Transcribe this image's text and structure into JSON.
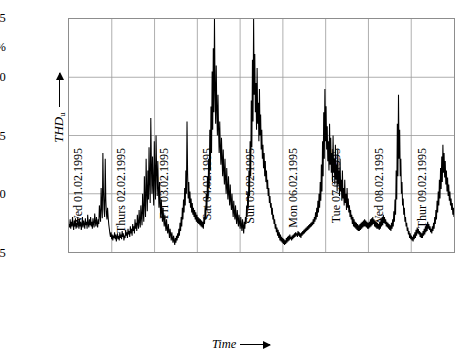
{
  "chart_data": {
    "type": "line",
    "title": "",
    "xlabel": "Time",
    "ylabel": "THD_u",
    "ylabel_display": "THD",
    "ylabel_subscript": "u",
    "yunit": "%",
    "ylim": [
      0.5,
      2.5
    ],
    "yticks": [
      0.5,
      1.0,
      1.5,
      2.0,
      2.5
    ],
    "ytick_labels": [
      "0.5",
      "1.0",
      "1.5",
      "2.0",
      "2.5"
    ],
    "grid": true,
    "legend": false,
    "xlim": [
      0,
      9
    ],
    "xtick_labels": [
      "Wed 01.02.1995",
      "Thurs 02.02.1995",
      "Fri 03.02.1995",
      "Sat 04.02.1995",
      "Sun 05.02.1995",
      "Mon 06.02.1995",
      "Tue 07.02.1995",
      "Wed 08.02.1995",
      "Thur 09.02.1995"
    ],
    "series": [
      {
        "name": "THD_u",
        "color": "#000000",
        "note": "Voltage total harmonic distortion sampled over 9 days; baseline 0.6-0.8 % with daytime excursions and narrow spikes up to 2.55 %.",
        "values": [
          0.74,
          0.71,
          0.78,
          0.7,
          0.76,
          0.72,
          0.8,
          0.73,
          0.69,
          0.77,
          0.72,
          0.79,
          0.7,
          0.75,
          0.71,
          0.8,
          0.74,
          0.7,
          0.78,
          0.72,
          0.76,
          0.69,
          0.73,
          0.8,
          0.71,
          0.77,
          0.74,
          0.7,
          0.79,
          0.73,
          0.76,
          0.7,
          0.82,
          0.74,
          0.71,
          0.78,
          0.73,
          0.8,
          0.72,
          0.76,
          0.7,
          0.79,
          0.74,
          0.71,
          0.83,
          0.76,
          0.72,
          0.8,
          0.75,
          0.71,
          0.78,
          0.74,
          0.9,
          0.82,
          0.76,
          1.05,
          0.88,
          0.79,
          1.35,
          1.02,
          0.86,
          0.8,
          1.3,
          0.95,
          0.83,
          0.78,
          0.88,
          0.8,
          0.74,
          0.7,
          0.66,
          0.63,
          0.67,
          0.61,
          0.65,
          0.6,
          0.64,
          0.62,
          0.67,
          0.61,
          0.65,
          0.59,
          0.63,
          0.66,
          0.61,
          0.64,
          0.6,
          0.67,
          0.62,
          0.65,
          0.61,
          0.68,
          0.63,
          0.66,
          0.6,
          0.64,
          0.62,
          0.69,
          0.64,
          0.67,
          0.62,
          0.7,
          0.65,
          0.68,
          0.63,
          0.72,
          0.66,
          0.7,
          0.64,
          0.74,
          0.68,
          0.72,
          0.66,
          0.78,
          0.7,
          0.75,
          0.68,
          0.82,
          0.74,
          0.7,
          0.86,
          0.76,
          0.71,
          0.9,
          0.8,
          0.73,
          1.0,
          0.85,
          0.76,
          1.15,
          0.92,
          0.8,
          1.3,
          1.02,
          0.85,
          1.2,
          0.95,
          1.4,
          1.1,
          0.92,
          1.65,
          1.25,
          1.0,
          1.32,
          1.08,
          0.9,
          1.45,
          1.15,
          0.95,
          1.5,
          1.2,
          0.98,
          1.28,
          1.05,
          0.88,
          1.1,
          0.92,
          0.8,
          0.95,
          0.84,
          0.76,
          0.88,
          0.78,
          0.72,
          0.82,
          0.74,
          0.68,
          0.78,
          0.7,
          0.66,
          0.74,
          0.68,
          0.62,
          0.7,
          0.65,
          0.6,
          0.67,
          0.62,
          0.58,
          0.64,
          0.6,
          0.56,
          0.62,
          0.58,
          0.64,
          0.6,
          0.66,
          0.62,
          0.7,
          0.64,
          0.75,
          0.68,
          0.8,
          0.72,
          0.88,
          0.78,
          0.95,
          0.84,
          1.05,
          0.9,
          1.2,
          1.0,
          1.62,
          1.18,
          0.96,
          1.1,
          0.92,
          1.02,
          0.88,
          0.96,
          0.84,
          0.92,
          0.82,
          0.88,
          0.8,
          0.86,
          0.78,
          0.84,
          0.76,
          0.82,
          0.75,
          0.8,
          0.74,
          0.79,
          0.73,
          0.78,
          0.72,
          0.77,
          0.71,
          0.76,
          0.7,
          0.8,
          0.74,
          0.88,
          0.78,
          1.0,
          0.86,
          1.15,
          0.95,
          1.3,
          1.05,
          1.55,
          1.2,
          1.75,
          1.35,
          2.05,
          1.55,
          2.25,
          1.7,
          2.55,
          1.9,
          1.6,
          2.1,
          1.72,
          1.5,
          1.85,
          1.55,
          1.35,
          1.62,
          1.4,
          1.25,
          1.48,
          1.3,
          1.15,
          1.38,
          1.2,
          1.08,
          1.3,
          1.12,
          1.0,
          1.22,
          1.05,
          0.95,
          1.15,
          1.0,
          0.9,
          1.08,
          0.94,
          0.86,
          1.0,
          0.88,
          0.8,
          0.94,
          0.84,
          0.78,
          0.9,
          0.8,
          0.74,
          0.86,
          0.78,
          0.72,
          0.82,
          0.75,
          0.7,
          0.8,
          0.73,
          0.68,
          0.78,
          0.72,
          0.66,
          0.76,
          0.7,
          0.8,
          0.74,
          0.9,
          0.8,
          1.02,
          0.88,
          1.2,
          0.98,
          1.45,
          1.15,
          1.8,
          1.4,
          2.15,
          1.62,
          2.5,
          1.85,
          2.2,
          1.7,
          1.95,
          1.55,
          2.08,
          1.6,
          1.78,
          1.45,
          1.9,
          1.5,
          1.68,
          1.38,
          1.55,
          1.3,
          1.42,
          1.22,
          1.35,
          1.15,
          1.28,
          1.1,
          1.2,
          1.04,
          1.12,
          0.98,
          1.05,
          0.92,
          0.98,
          0.88,
          0.92,
          0.82,
          0.88,
          0.78,
          0.82,
          0.74,
          0.78,
          0.7,
          0.74,
          0.67,
          0.71,
          0.64,
          0.69,
          0.62,
          0.67,
          0.6,
          0.65,
          0.59,
          0.63,
          0.58,
          0.62,
          0.57,
          0.61,
          0.56,
          0.6,
          0.57,
          0.62,
          0.58,
          0.63,
          0.59,
          0.64,
          0.6,
          0.65,
          0.61,
          0.63,
          0.6,
          0.64,
          0.61,
          0.65,
          0.62,
          0.66,
          0.63,
          0.67,
          0.64,
          0.66,
          0.63,
          0.68,
          0.64,
          0.67,
          0.63,
          0.66,
          0.62,
          0.67,
          0.64,
          0.68,
          0.65,
          0.69,
          0.66,
          0.7,
          0.67,
          0.71,
          0.68,
          0.72,
          0.69,
          0.73,
          0.7,
          0.74,
          0.71,
          0.75,
          0.72,
          0.76,
          0.73,
          0.78,
          0.74,
          0.8,
          0.76,
          0.84,
          0.78,
          0.88,
          0.8,
          0.94,
          0.84,
          1.0,
          0.88,
          1.1,
          0.94,
          1.25,
          1.02,
          1.45,
          1.15,
          1.7,
          1.3,
          1.9,
          1.45,
          1.75,
          1.38,
          1.58,
          1.28,
          1.45,
          1.2,
          1.6,
          1.25,
          1.48,
          1.18,
          1.35,
          1.1,
          1.5,
          1.18,
          1.3,
          1.08,
          1.42,
          1.12,
          1.25,
          1.02,
          1.38,
          1.08,
          1.2,
          0.98,
          1.3,
          1.02,
          1.12,
          0.94,
          1.2,
          0.96,
          1.05,
          0.9,
          1.12,
          0.92,
          1.0,
          0.86,
          1.05,
          0.88,
          0.96,
          0.84,
          0.9,
          0.8,
          0.86,
          0.78,
          0.82,
          0.74,
          0.8,
          0.72,
          0.78,
          0.71,
          0.76,
          0.7,
          0.75,
          0.69,
          0.74,
          0.68,
          0.73,
          0.68,
          0.74,
          0.69,
          0.75,
          0.7,
          0.76,
          0.71,
          0.77,
          0.72,
          0.78,
          0.72,
          0.77,
          0.71,
          0.76,
          0.7,
          0.75,
          0.7,
          0.76,
          0.71,
          0.78,
          0.72,
          0.79,
          0.73,
          0.8,
          0.74,
          0.78,
          0.72,
          0.77,
          0.71,
          0.76,
          0.7,
          0.75,
          0.7,
          0.74,
          0.69,
          0.76,
          0.7,
          0.78,
          0.72,
          0.8,
          0.73,
          0.82,
          0.75,
          0.8,
          0.74,
          0.78,
          0.72,
          0.76,
          0.71,
          0.75,
          0.7,
          0.74,
          0.69,
          0.73,
          0.68,
          0.75,
          0.7,
          0.78,
          0.72,
          0.85,
          0.76,
          0.95,
          0.82,
          1.2,
          0.95,
          1.6,
          1.15,
          1.85,
          1.3,
          1.55,
          1.15,
          1.3,
          1.0,
          1.1,
          0.9,
          0.96,
          0.82,
          0.88,
          0.76,
          0.8,
          0.72,
          0.75,
          0.68,
          0.71,
          0.65,
          0.68,
          0.62,
          0.66,
          0.61,
          0.64,
          0.6,
          0.63,
          0.59,
          0.65,
          0.61,
          0.67,
          0.62,
          0.69,
          0.64,
          0.71,
          0.66,
          0.7,
          0.65,
          0.68,
          0.63,
          0.67,
          0.62,
          0.66,
          0.62,
          0.68,
          0.64,
          0.7,
          0.65,
          0.72,
          0.67,
          0.74,
          0.68,
          0.76,
          0.7,
          0.74,
          0.69,
          0.72,
          0.67,
          0.7,
          0.66,
          0.72,
          0.68,
          0.75,
          0.7,
          0.8,
          0.74,
          0.86,
          0.78,
          0.94,
          0.84,
          1.02,
          0.9,
          1.12,
          0.96,
          1.22,
          1.04,
          1.32,
          1.1,
          1.42,
          1.18,
          1.35,
          1.14,
          1.28,
          1.08,
          1.2,
          1.02,
          1.14,
          0.98,
          1.08,
          0.94,
          1.02,
          0.9,
          0.96,
          0.86,
          0.92,
          0.82,
          0.88,
          0.8
        ]
      }
    ]
  },
  "axis": {
    "y_title_main": "THD",
    "y_title_sub": "u",
    "y_unit": "%",
    "x_title": "Time"
  }
}
